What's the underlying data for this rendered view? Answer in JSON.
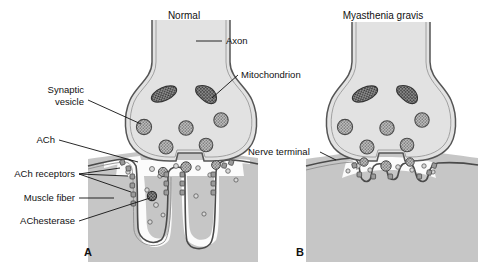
{
  "figure": {
    "type": "biological-diagram",
    "width": 491,
    "height": 268,
    "background_color": "#ffffff"
  },
  "colors": {
    "terminal_fill": "#e2e2e2",
    "terminal_stroke": "#555555",
    "muscle_fill": "#c6c6c6",
    "muscle_stroke": "#4a4a4a",
    "cleft_fill": "#fbfbfb",
    "vesicle_fill": "#b4b4b4",
    "vesicle_stroke": "#4a4a4a",
    "mitochondrion_fill": "#7d7d7d",
    "mitochondrion_stroke": "#333333",
    "receptor_fill": "#9a9a9a",
    "ach_fill": "#d0d0d0",
    "text_color": "#111111",
    "leader_color": "#111111"
  },
  "panels": [
    {
      "id": "A",
      "letter": "A",
      "title": "Normal",
      "description": "Normal neuromuscular junction with abundant ACh receptors and deep junctional folds"
    },
    {
      "id": "B",
      "letter": "B",
      "title": "Myasthenia gravis",
      "description": "Myasthenia gravis junction with simplified flattened cleft and reduced ACh receptors"
    }
  ],
  "labels": {
    "axon": "Axon",
    "mitochondrion": "Mitochondrion",
    "synaptic_vesicle_line1": "Synaptic",
    "synaptic_vesicle_line2": "vesicle",
    "ach": "ACh",
    "ach_receptors": "ACh receptors",
    "muscle_fiber": "Muscle fiber",
    "achesterase": "AChesterase",
    "nerve_terminal": "Nerve terminal"
  }
}
